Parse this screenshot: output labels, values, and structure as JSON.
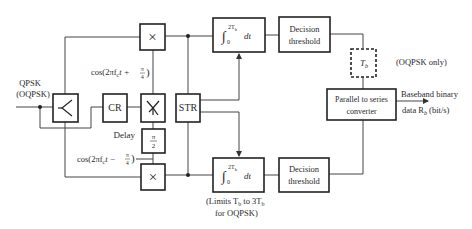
{
  "diagram": {
    "input": {
      "label_line1": "QPSK",
      "label_line2": "(OQPSK)"
    },
    "blocks": {
      "carrier_recovery": "CR",
      "symbol_timing_recovery": "STR",
      "top_multiplier": "×",
      "bottom_multiplier": "×",
      "top_integrator": {
        "integral": "∫",
        "upper": "2T",
        "upper_sub": "b",
        "lower": "0",
        "dt": "dt"
      },
      "bottom_integrator": {
        "integral": "∫",
        "upper": "2T",
        "upper_sub": "b",
        "lower": "0",
        "dt": "dt"
      },
      "top_decision": {
        "line1": "Decision",
        "line2": "threshold"
      },
      "bottom_decision": {
        "line1": "Decision",
        "line2": "threshold"
      },
      "delay_tb": {
        "main": "T",
        "sub": "b"
      },
      "phase_shift": {
        "num": "π",
        "den": "2"
      },
      "parallel_to_series": {
        "line1": "Parallel to series",
        "line2": "converter"
      }
    },
    "labels": {
      "cos_top": "cos(2πf",
      "cos_top_sub": "c",
      "cos_top_rest": "t + ",
      "cos_top_frac_num": "π",
      "cos_top_frac_den": "4",
      "cos_bottom": "cos(2πf",
      "cos_bottom_sub": "c",
      "cos_bottom_rest": "t − ",
      "cos_bottom_frac_num": "π",
      "cos_bottom_frac_den": "4",
      "delay": "Delay",
      "oqpsk_only": "(OQPSK only)",
      "limits_line1_a": "(Limits T",
      "limits_line1_sub1": "b",
      "limits_line1_b": " to 3T",
      "limits_line1_sub2": "b",
      "limits_line2": "for OQPSK)",
      "output_line1": "Baseband binary",
      "output_line2_a": "data R",
      "output_line2_sub": "b",
      "output_line2_b": " (bit/s)"
    }
  }
}
